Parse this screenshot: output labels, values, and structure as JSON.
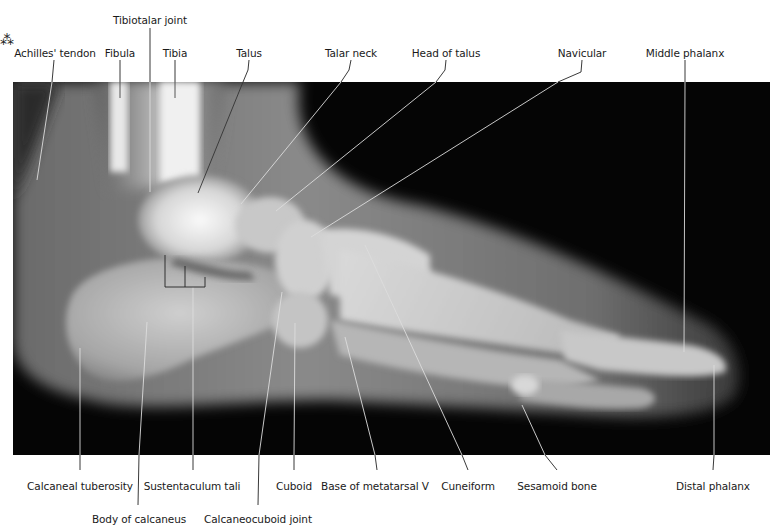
{
  "figure": {
    "panel": {
      "x": 13,
      "y": 82,
      "width": 757,
      "height": 373,
      "background": "#050505"
    },
    "label_color": "#1a1a1a",
    "line_color_on_dark": "#dddddd",
    "line_color_on_light": "#222222"
  },
  "labels_top": [
    {
      "id": "tibiotalar-joint",
      "text": "Tibiotalar joint",
      "x": 150,
      "y": 14
    },
    {
      "id": "achilles-tendon",
      "text": "Achilles' tendon",
      "x": 55,
      "y": 47
    },
    {
      "id": "fibula",
      "text": "Fibula",
      "x": 120,
      "y": 47
    },
    {
      "id": "tibia",
      "text": "Tibia",
      "x": 175,
      "y": 47
    },
    {
      "id": "talus",
      "text": "Talus",
      "x": 249,
      "y": 47
    },
    {
      "id": "talar-neck",
      "text": "Talar neck",
      "x": 351,
      "y": 47
    },
    {
      "id": "head-of-talus",
      "text": "Head of talus",
      "x": 446,
      "y": 47
    },
    {
      "id": "navicular",
      "text": "Navicular",
      "x": 582,
      "y": 47
    },
    {
      "id": "middle-phalanx",
      "text": "Middle phalanx",
      "x": 685,
      "y": 47
    }
  ],
  "labels_bottom": [
    {
      "id": "calcaneal-tuberosity",
      "text": "Calcaneal tuberosity",
      "x": 80,
      "y": 480
    },
    {
      "id": "sustentaculum-tali",
      "text": "Sustentaculum tali",
      "x": 192,
      "y": 480
    },
    {
      "id": "cuboid",
      "text": "Cuboid",
      "x": 294,
      "y": 480
    },
    {
      "id": "base-of-metatarsal-v",
      "text": "Base of metatarsal V",
      "x": 375,
      "y": 480
    },
    {
      "id": "cuneiform",
      "text": "Cuneiform",
      "x": 468,
      "y": 480
    },
    {
      "id": "sesamoid-bone",
      "text": "Sesamoid bone",
      "x": 557,
      "y": 480
    },
    {
      "id": "distal-phalanx",
      "text": "Distal phalanx",
      "x": 713,
      "y": 480
    },
    {
      "id": "body-of-calcaneus",
      "text": "Body of calcaneus",
      "x": 139,
      "y": 513
    },
    {
      "id": "calcaneocuboid-joint",
      "text": "Calcaneocuboid joint",
      "x": 258,
      "y": 513
    }
  ]
}
